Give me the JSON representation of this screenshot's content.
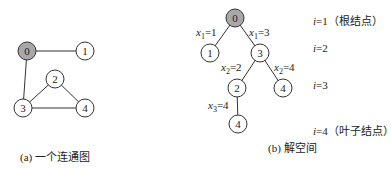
{
  "graph_a": {
    "caption": "(a) 一个连通图",
    "nodes": [
      {
        "id": "0",
        "x": 27,
        "y": 51,
        "highlight": true
      },
      {
        "id": "1",
        "x": 85,
        "y": 51,
        "highlight": false
      },
      {
        "id": "2",
        "x": 55,
        "y": 79,
        "highlight": false
      },
      {
        "id": "3",
        "x": 23,
        "y": 108,
        "highlight": false
      },
      {
        "id": "4",
        "x": 85,
        "y": 108,
        "highlight": false
      }
    ],
    "edges": [
      [
        "0",
        "1"
      ],
      [
        "0",
        "3"
      ],
      [
        "3",
        "2"
      ],
      [
        "2",
        "4"
      ],
      [
        "3",
        "4"
      ]
    ]
  },
  "tree_b": {
    "caption": "(b) 解空间",
    "nodes": [
      {
        "key": "r",
        "id": "0",
        "x": 235,
        "y": 18,
        "highlight": true
      },
      {
        "key": "a",
        "id": "1",
        "x": 210,
        "y": 53,
        "highlight": false
      },
      {
        "key": "b",
        "id": "3",
        "x": 260,
        "y": 53,
        "highlight": false
      },
      {
        "key": "c",
        "id": "2",
        "x": 237,
        "y": 88,
        "highlight": false
      },
      {
        "key": "d",
        "id": "4",
        "x": 283,
        "y": 88,
        "highlight": false
      },
      {
        "key": "e",
        "id": "4",
        "x": 238,
        "y": 124,
        "highlight": false
      }
    ],
    "edges": [
      [
        "r",
        "a"
      ],
      [
        "r",
        "b"
      ],
      [
        "b",
        "c"
      ],
      [
        "b",
        "d"
      ],
      [
        "c",
        "e"
      ]
    ],
    "edge_labels": [
      {
        "var": "x",
        "sub": "1",
        "val": "=1",
        "x": 196,
        "y": 26
      },
      {
        "var": "x",
        "sub": "1",
        "val": "=3",
        "x": 249,
        "y": 26
      },
      {
        "var": "x",
        "sub": "2",
        "val": "=2",
        "x": 221,
        "y": 61
      },
      {
        "var": "x",
        "sub": "2",
        "val": "=4",
        "x": 274,
        "y": 61
      },
      {
        "var": "x",
        "sub": "3",
        "val": "=4",
        "x": 208,
        "y": 99
      }
    ]
  },
  "levels": [
    {
      "text": "i=1（根结点）",
      "i": "i",
      "rest": "=1（根结点）",
      "y": 12
    },
    {
      "text": "i=2",
      "i": "i",
      "rest": "=2",
      "y": 42
    },
    {
      "text": "i=3",
      "i": "i",
      "rest": "=3",
      "y": 79
    },
    {
      "text": "i=4（叶子结点）",
      "i": "i",
      "rest": "=4（叶子结点）",
      "y": 122
    }
  ],
  "colors": {
    "node_fill": "#ffffff",
    "highlight_fill": "#a8a8a8",
    "stroke": "#333333"
  }
}
